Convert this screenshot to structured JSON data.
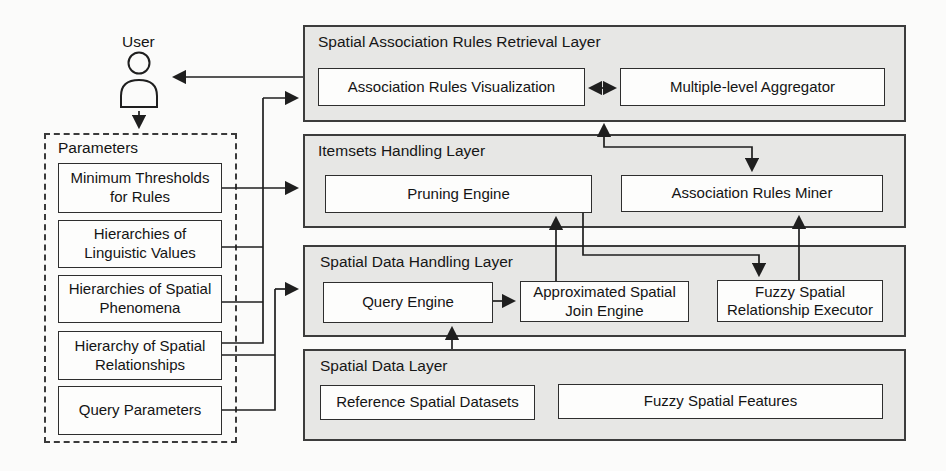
{
  "user": {
    "label": "User"
  },
  "parameters": {
    "title": "Parameters",
    "items": [
      {
        "label": "Minimum Thresholds for Rules"
      },
      {
        "label": "Hierarchies of Linguistic Values"
      },
      {
        "label": "Hierarchies of Spatial Phenomena"
      },
      {
        "label": "Hierarchy of Spatial Relationships"
      },
      {
        "label": "Query Parameters"
      }
    ]
  },
  "layers": [
    {
      "title": "Spatial Association Rules Retrieval Layer",
      "boxes": [
        {
          "label": "Association Rules Visualization"
        },
        {
          "label": "Multiple-level Aggregator"
        }
      ]
    },
    {
      "title": "Itemsets Handling Layer",
      "boxes": [
        {
          "label": "Pruning Engine"
        },
        {
          "label": "Association Rules Miner"
        }
      ]
    },
    {
      "title": "Spatial Data Handling Layer",
      "boxes": [
        {
          "label": "Query Engine"
        },
        {
          "label": "Approximated Spatial Join Engine"
        },
        {
          "label": "Fuzzy Spatial Relationship Executor"
        }
      ]
    },
    {
      "title": "Spatial Data Layer",
      "boxes": [
        {
          "label": "Reference Spatial Datasets"
        },
        {
          "label": "Fuzzy Spatial Features"
        }
      ]
    }
  ],
  "connections": [
    {
      "from": "Association Rules Visualization",
      "to": "User",
      "direction": "one-way"
    },
    {
      "from": "User",
      "to": "Parameters",
      "direction": "one-way"
    },
    {
      "from": "Minimum Thresholds for Rules",
      "to": "Itemsets Handling Layer",
      "direction": "one-way"
    },
    {
      "from": "Hierarchies of Linguistic Values / Spatial Phenomena / Spatial Relationships",
      "to": "Spatial Association Rules Retrieval Layer",
      "direction": "one-way"
    },
    {
      "from": "Hierarchy of Spatial Relationships / Query Parameters",
      "to": "Spatial Data Handling Layer",
      "direction": "one-way"
    },
    {
      "from": "Association Rules Visualization",
      "to": "Multiple-level Aggregator",
      "direction": "two-way"
    },
    {
      "from": "Spatial Association Rules Retrieval Layer",
      "to": "Association Rules Miner",
      "direction": "two-way"
    },
    {
      "from": "Approximated Spatial Join Engine",
      "to": "Pruning Engine",
      "direction": "one-way"
    },
    {
      "from": "Pruning Engine",
      "to": "Fuzzy Spatial Relationship Executor",
      "direction": "one-way"
    },
    {
      "from": "Fuzzy Spatial Relationship Executor",
      "to": "Association Rules Miner",
      "direction": "one-way"
    },
    {
      "from": "Query Engine",
      "to": "Approximated Spatial Join Engine",
      "direction": "one-way"
    },
    {
      "from": "Spatial Data Layer",
      "to": "Query Engine",
      "direction": "one-way"
    }
  ],
  "colors": {
    "layer_fill": "#e7e7e5",
    "layer_border": "#3c3c3c",
    "box_fill": "#fdfdfc",
    "box_border": "#2e2e2e",
    "line": "#1f1f1f",
    "text": "#141414",
    "background": "#fbfbfa"
  }
}
